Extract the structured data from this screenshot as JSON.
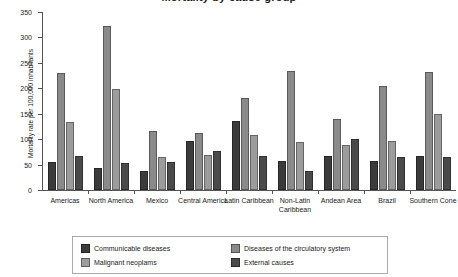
{
  "title": "Mortality by cause group",
  "chart_data": {
    "type": "bar",
    "title": "Mortality by cause group",
    "xlabel": "",
    "ylabel": "Mortality rate per 100,000 inhabitants",
    "ylim": [
      0,
      350
    ],
    "yticks": [
      0,
      50,
      100,
      150,
      200,
      250,
      300,
      350
    ],
    "grid": false,
    "legend_position": "bottom",
    "categories": [
      "Americas",
      "North America",
      "Mexico",
      "Central America",
      "Latin Caribbean",
      "Non-Latin Caribbean",
      "Andean Area",
      "Brazil",
      "Southern Cone"
    ],
    "series": [
      {
        "name": "Communicable diseases",
        "color": "#3b3b3b",
        "values": [
          55,
          43,
          37,
          96,
          136,
          58,
          66,
          57,
          66
        ]
      },
      {
        "name": "Diseases of the circulatory system",
        "color": "#8a8a8a",
        "values": [
          230,
          322,
          117,
          112,
          181,
          235,
          140,
          205,
          233
        ]
      },
      {
        "name": "Malignant neoplams",
        "color": "#9c9c9c",
        "values": [
          133,
          199,
          65,
          68,
          109,
          94,
          88,
          97,
          149
        ]
      },
      {
        "name": "External causes",
        "color": "#4a4a4a",
        "values": [
          67,
          54,
          56,
          77,
          66,
          37,
          101,
          65,
          64
        ]
      }
    ]
  },
  "legend": {
    "items": [
      {
        "label": "Communicable diseases",
        "color": "#3b3b3b"
      },
      {
        "label": "Diseases of the circulatory system",
        "color": "#8a8a8a"
      },
      {
        "label": "Malignant neoplams",
        "color": "#9c9c9c"
      },
      {
        "label": "External causes",
        "color": "#4a4a4a"
      }
    ]
  }
}
